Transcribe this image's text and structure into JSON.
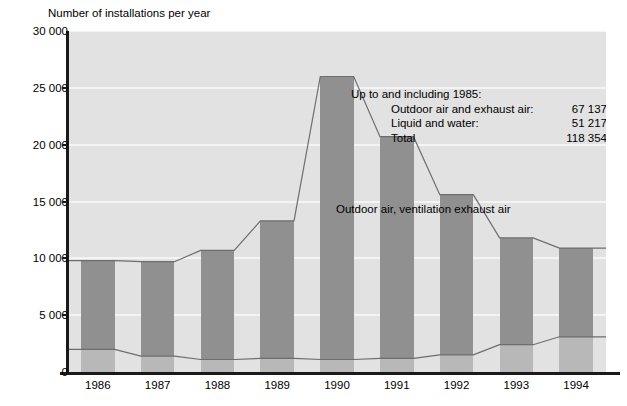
{
  "chart_data": {
    "type": "bar",
    "title": "Number of installations per year",
    "xlabel": "",
    "ylabel": "Number of installations per year",
    "categories": [
      "1986",
      "1987",
      "1988",
      "1989",
      "1990",
      "1991",
      "1992",
      "1993",
      "1994"
    ],
    "series": [
      {
        "name": "Outdoor air, ventilation exhaust air",
        "values": [
          9800,
          9700,
          10700,
          13300,
          26000,
          20700,
          15600,
          11800,
          10900
        ],
        "color": "#909090"
      },
      {
        "name": "Liquid, water",
        "values": [
          2000,
          1400,
          1100,
          1200,
          1100,
          1200,
          1500,
          2400,
          3100
        ],
        "color": "#b8b8b8"
      }
    ],
    "ylim": [
      0,
      30000
    ],
    "yticks": [
      0,
      5000,
      10000,
      15000,
      20000,
      25000,
      30000
    ],
    "ytick_labels": [
      "0",
      "5 000",
      "10 000",
      "15 000",
      "20 000",
      "25 000",
      "30 000"
    ],
    "grid": true,
    "legend": "in-plot-labels",
    "plot_background": "#e2e2e2"
  },
  "axis_title": "Number of installations per year",
  "series_labels": {
    "outdoor": "Outdoor air, ventilation exhaust air",
    "liquid": "Liquid, water"
  },
  "annotation": {
    "title": "Up to and including 1985:",
    "rows": [
      {
        "label": "Outdoor air and exhaust air:",
        "value": "67 137"
      },
      {
        "label": "Liquid and water:",
        "value": "51 217"
      },
      {
        "label": "Total",
        "value": "118 354"
      }
    ]
  }
}
